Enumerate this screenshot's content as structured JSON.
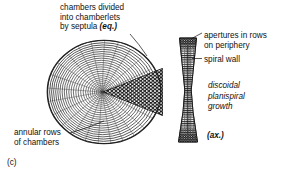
{
  "figure": {
    "part_label": "(c)",
    "background_color": "#ffffff",
    "ink_color": "#111111"
  },
  "labels": {
    "chambers": {
      "line1": "chambers divided",
      "line2": "into chamberlets",
      "line3_prefix": "by septula ",
      "line3_emphasis": "(eq.)"
    },
    "annular": {
      "line1": "annular rows",
      "line2": "of chambers"
    },
    "apertures": {
      "line1": "apertures in rows",
      "line2": "on periphery"
    },
    "spiral_wall": "spiral wall",
    "growth": {
      "line1": "discoidal",
      "line2": "planispiral",
      "line3": "growth"
    },
    "axial": "(ax.)"
  },
  "diagram": {
    "equatorial_section": {
      "name": "equatorial-section",
      "description": "discoidal test with concentric annular chamber rows",
      "center_x": 104,
      "center_y": 92,
      "radius_x": 57,
      "radius_y": 52,
      "ring_count": 26,
      "wedge": {
        "name": "chamberlet-wedge",
        "apex_x": 103,
        "apex_y": 92,
        "angle_start_deg": -22,
        "angle_end_deg": 22,
        "fill": "#1a1a1a",
        "chamberlet_dot_color": "#ffffff"
      }
    },
    "axial_section": {
      "name": "axial-section",
      "description": "biconcave hourglass axial profile with peripheral apertures",
      "center_x": 188,
      "top_y": 38,
      "bottom_y": 142,
      "half_width_top": 8.5,
      "half_width_waist": 3.2,
      "half_width_bottom": 9.5
    }
  }
}
